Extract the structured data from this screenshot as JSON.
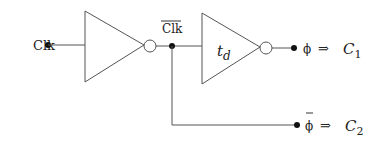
{
  "diagram": {
    "type": "circuit",
    "input": {
      "label": "Clk"
    },
    "gates": [
      {
        "type": "inverter",
        "label": ""
      },
      {
        "type": "inverter",
        "label_main": "t",
        "label_sub": "d"
      }
    ],
    "intermediate": {
      "label": "Clk",
      "overline": true
    },
    "outputs": [
      {
        "signal": "ϕ",
        "overline": false,
        "arrow": "⇒",
        "target_main": "C",
        "target_sub": "1"
      },
      {
        "signal": "ϕ",
        "overline": true,
        "arrow": "⇒",
        "target_main": "C",
        "target_sub": "2"
      }
    ],
    "colors": {
      "stroke": "#555555",
      "dot": "#111111",
      "text": "#222222",
      "background": "#ffffff"
    }
  }
}
